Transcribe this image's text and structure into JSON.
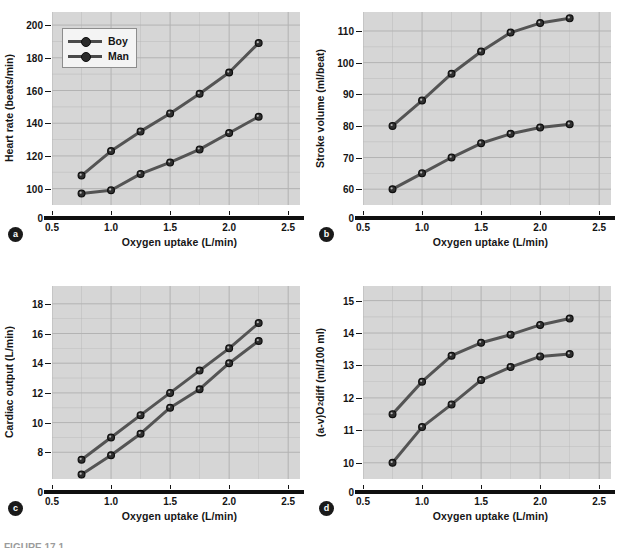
{
  "figure": {
    "caption": "FIGURE 17.1",
    "legend": {
      "series": [
        {
          "key": "boy",
          "label": "Boy"
        },
        {
          "key": "man",
          "label": "Man"
        }
      ]
    }
  },
  "chart_data": [
    {
      "id": "a",
      "panel_label": "a",
      "type": "line",
      "title": "",
      "xlabel": "Oxygen uptake (L/min)",
      "ylabel": "Heart rate (beats/min)",
      "ylabel_html": "Heart rate (beats/min)",
      "x": [
        0.75,
        1.0,
        1.25,
        1.5,
        1.75,
        2.0,
        2.25
      ],
      "xlim": [
        0.5,
        2.6
      ],
      "ylim": [
        90,
        208
      ],
      "xticks": [
        "0.5",
        "1.0",
        "1.5",
        "2.0",
        "2.5"
      ],
      "xtick_values": [
        0.5,
        1.0,
        1.5,
        2.0,
        2.5
      ],
      "yticks": [
        "100",
        "120",
        "140",
        "160",
        "180",
        "200"
      ],
      "ytick_values": [
        100,
        120,
        140,
        160,
        180,
        200
      ],
      "y_origin_label": "0",
      "axis_break": true,
      "grid": true,
      "legend_position": "upper-left",
      "series": [
        {
          "name": "Man",
          "values": [
            108,
            123,
            135,
            146,
            158,
            171,
            189
          ]
        },
        {
          "name": "Boy",
          "values": [
            97,
            99,
            109,
            116,
            124,
            134,
            144
          ]
        }
      ]
    },
    {
      "id": "b",
      "panel_label": "b",
      "type": "line",
      "title": "",
      "xlabel": "Oxygen uptake (L/min)",
      "ylabel": "Stroke volume (ml/beat)",
      "ylabel_html": "Stroke volume (ml/beat)",
      "x": [
        0.75,
        1.0,
        1.25,
        1.5,
        1.75,
        2.0,
        2.25
      ],
      "xlim": [
        0.5,
        2.6
      ],
      "ylim": [
        55,
        116
      ],
      "xticks": [
        "0.5",
        "1.0",
        "1.5",
        "2.0",
        "2.5"
      ],
      "xtick_values": [
        0.5,
        1.0,
        1.5,
        2.0,
        2.5
      ],
      "yticks": [
        "60",
        "70",
        "80",
        "90",
        "100",
        "110"
      ],
      "ytick_values": [
        60,
        70,
        80,
        90,
        100,
        110
      ],
      "y_origin_label": "0",
      "axis_break": true,
      "grid": true,
      "legend_position": "none",
      "series": [
        {
          "name": "Man",
          "values": [
            80,
            88,
            96.5,
            103.5,
            109.5,
            112.5,
            114
          ]
        },
        {
          "name": "Boy",
          "values": [
            60,
            65,
            70,
            74.5,
            77.5,
            79.5,
            80.5
          ]
        }
      ]
    },
    {
      "id": "c",
      "panel_label": "c",
      "type": "line",
      "title": "",
      "xlabel": "Oxygen uptake (L/min)",
      "ylabel": "Cardiac output (L/min)",
      "ylabel_html": "Cardiac output (L/min)",
      "x": [
        0.75,
        1.0,
        1.25,
        1.5,
        1.75,
        2.0,
        2.25
      ],
      "xlim": [
        0.5,
        2.6
      ],
      "ylim": [
        6.2,
        19.2
      ],
      "xticks": [
        "0.5",
        "1.0",
        "1.5",
        "2.0",
        "2.5"
      ],
      "xtick_values": [
        0.5,
        1.0,
        1.5,
        2.0,
        2.5
      ],
      "yticks": [
        "8",
        "10",
        "12",
        "14",
        "16",
        "18"
      ],
      "ytick_values": [
        8,
        10,
        12,
        14,
        16,
        18
      ],
      "y_origin_label": "0",
      "axis_break": true,
      "grid": true,
      "legend_position": "none",
      "series": [
        {
          "name": "Man",
          "values": [
            7.5,
            9.0,
            10.5,
            12.0,
            13.5,
            15.0,
            16.7
          ]
        },
        {
          "name": "Boy",
          "values": [
            6.5,
            7.8,
            9.25,
            11.0,
            12.25,
            14.0,
            15.5
          ]
        }
      ]
    },
    {
      "id": "d",
      "panel_label": "d",
      "type": "line",
      "title": "",
      "xlabel": "Oxygen uptake (L/min)",
      "ylabel": "(a-v)O2 diff (ml/100 ml)",
      "ylabel_html": "(a-v)O<sub>2</sub> diff (ml/100 ml)",
      "x": [
        0.75,
        1.0,
        1.25,
        1.5,
        1.75,
        2.0,
        2.25
      ],
      "xlim": [
        0.5,
        2.6
      ],
      "ylim": [
        9.5,
        15.45
      ],
      "xticks": [
        "0.5",
        "1.0",
        "1.5",
        "2.0",
        "2.5"
      ],
      "xtick_values": [
        0.5,
        1.0,
        1.5,
        2.0,
        2.5
      ],
      "yticks": [
        "10",
        "11",
        "12",
        "13",
        "14",
        "15"
      ],
      "ytick_values": [
        10,
        11,
        12,
        13,
        14,
        15
      ],
      "y_origin_label": "0",
      "axis_break": true,
      "grid": true,
      "legend_position": "none",
      "series": [
        {
          "name": "Man",
          "values": [
            11.5,
            12.5,
            13.3,
            13.7,
            13.95,
            14.25,
            14.45
          ]
        },
        {
          "name": "Boy",
          "values": [
            10.0,
            11.1,
            11.8,
            12.55,
            12.95,
            13.28,
            13.35
          ]
        }
      ]
    }
  ],
  "style": {
    "plot_bg": "#d6d6d6",
    "grid_color": "#b3b3b3",
    "line_color": "#545454",
    "marker_fill": "#303030",
    "marker_edge": "#0f0f0f",
    "axis_color": "#141414",
    "baseline_color": "#101010",
    "text_color": "#161616"
  }
}
